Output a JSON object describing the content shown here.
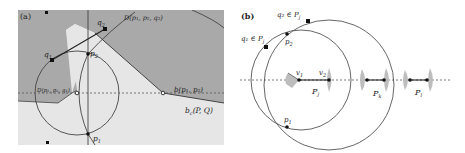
{
  "colors": {
    "dark_region": "#a9a9a9",
    "light_region": "#e6e6e6",
    "stroke": "#444444",
    "background": "#ffffff",
    "wedge": "#bdbdbd"
  },
  "panel_a": {
    "label": "(a)",
    "labels": {
      "q1": "q",
      "q1_sub": "1",
      "q2": "q",
      "q2_sub": "2",
      "p1": "p",
      "p1_sub": "1",
      "p2": "p",
      "p2_sub": "2",
      "disk_top": "D(p₁, p₂, q₂)",
      "disk_center": "D(p₁, p₂, q₁)",
      "bisector": "b(p₁, p₂)",
      "bc": "b",
      "bc_sub": "c",
      "bc_args": "(P, Q)"
    }
  },
  "panel_b": {
    "label": "(b)",
    "labels": {
      "q2_in": "q₂ ∈ P",
      "q2_sub": "j",
      "q1_in": "q₁ ∈ P",
      "q1_sub": "j",
      "p2": "p",
      "p2_sub": "2",
      "p1": "p",
      "p1_sub": "1",
      "v1": "v",
      "v1_sub": "1",
      "v2": "v",
      "v2_sub": "2",
      "Pj": "P",
      "Pj_sub": "j",
      "Pk": "P",
      "Pk_sub": "k",
      "Pl": "P",
      "Pl_sub": "l"
    }
  }
}
